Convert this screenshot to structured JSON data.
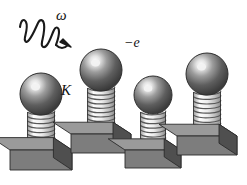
{
  "figure": {
    "background_color": "#ffffff"
  },
  "labels": {
    "omega": "ω",
    "charge": "−e",
    "spring_constant": "K"
  },
  "photon": {
    "name": "incident-photon-wave",
    "description": "zigzag wave with arrowhead",
    "color": "#1a1a1a",
    "arrow_target_x": 70,
    "arrow_target_y": 46
  },
  "colors": {
    "sphere_dark": "#4a4a4a",
    "sphere_mid": "#6f6f6f",
    "sphere_highlight": "#f2f2f2",
    "sphere_edge": "#2e2e2e",
    "spring_light": "#fbfbfb",
    "spring_shade": "#b9b9b9",
    "spring_line": "#585858",
    "block_top": "#9a9a9a",
    "block_front": "#7d7d7d",
    "block_side": "#4f4f4f",
    "outline": "#2b2b2b"
  },
  "oscillators": [
    {
      "id": 1,
      "label": "oscillator-1",
      "cx": 41,
      "sphere_cy": 94,
      "sphere_r": 21,
      "spring_top": 112,
      "spring_bottom": 152,
      "spring_w": 27,
      "coils": 9,
      "block_y": 150,
      "block_w": 62,
      "block_h": 20
    },
    {
      "id": 2,
      "label": "oscillator-2",
      "cx": 101,
      "sphere_cy": 70,
      "sphere_r": 21,
      "spring_top": 88,
      "spring_bottom": 136,
      "spring_w": 27,
      "coils": 11,
      "block_y": 134,
      "block_w": 60,
      "block_h": 19
    },
    {
      "id": 3,
      "label": "oscillator-3",
      "cx": 153,
      "sphere_cy": 95,
      "sphere_r": 19,
      "spring_top": 112,
      "spring_bottom": 152,
      "spring_w": 25,
      "coils": 9,
      "block_y": 150,
      "block_w": 56,
      "block_h": 18
    },
    {
      "id": 4,
      "label": "oscillator-4",
      "cx": 207,
      "sphere_cy": 74,
      "sphere_r": 21,
      "spring_top": 92,
      "spring_bottom": 138,
      "spring_w": 27,
      "coils": 10,
      "block_y": 136,
      "block_w": 60,
      "block_h": 19
    }
  ]
}
